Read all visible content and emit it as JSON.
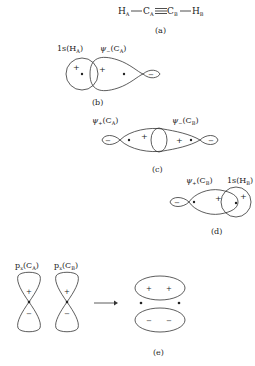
{
  "panels": {
    "a": {
      "caption": "(a)",
      "molecule": {
        "atoms": [
          {
            "symbol": "H",
            "sub": "A"
          },
          {
            "symbol": "C",
            "sub": "A"
          },
          {
            "symbol": "C",
            "sub": "B"
          },
          {
            "symbol": "H",
            "sub": "B"
          }
        ],
        "bonds": [
          "single",
          "triple",
          "single"
        ]
      }
    },
    "b": {
      "caption": "(b)",
      "label_left": "1s(H",
      "label_left_sub": "A",
      "label_right": "ψ",
      "label_right_sub": "−",
      "label_right_atom": "(C",
      "label_right_atom_sub": "A",
      "signs": [
        "+",
        "+",
        "−"
      ]
    },
    "c": {
      "caption": "(c)",
      "label_left": "ψ",
      "label_left_sub": "+",
      "label_left_atom": "(C",
      "label_left_atom_sub": "A",
      "label_right": "ψ",
      "label_right_sub": "−",
      "label_right_atom": "(C",
      "label_right_atom_sub": "B",
      "signs": [
        "−",
        "+",
        "+",
        "−"
      ]
    },
    "d": {
      "caption": "(d)",
      "label_left": "ψ",
      "label_left_sub": "+",
      "label_left_atom": "(C",
      "label_left_atom_sub": "B",
      "label_right": "1s(H",
      "label_right_sub": "B",
      "signs": [
        "−",
        "+",
        "+"
      ]
    },
    "e": {
      "caption": "(e)",
      "label_left": "p",
      "label_left_sub": "x",
      "label_left_atom": "(C",
      "label_left_atom_sub": "A",
      "label_right": "p",
      "label_right_sub": "x",
      "label_right_atom": "(C",
      "label_right_atom_sub": "B",
      "signs_p": [
        "+",
        "−",
        "+",
        "−"
      ],
      "signs_pi": [
        "+",
        "+",
        "−",
        "−"
      ],
      "arrow": "→"
    }
  }
}
